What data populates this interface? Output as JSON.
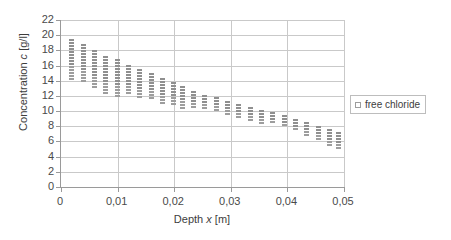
{
  "chart_data": {
    "type": "scatter",
    "title": "",
    "xlabel": "Depth x [m]",
    "ylabel": "Concentration c [g/l]",
    "xlim": [
      0,
      0.05
    ],
    "ylim": [
      0,
      22
    ],
    "ytick_step": 2,
    "xtick_step": 0.01,
    "grid": true,
    "legend_position": "right",
    "decimal_separator": ",",
    "series": [
      {
        "name": "free chloride",
        "marker": "open-square",
        "color": "#b4b4b4",
        "points": [
          {
            "x": 0.002,
            "y_low": 13.9,
            "y_high": 19.5
          },
          {
            "x": 0.004,
            "y_low": 13.8,
            "y_high": 18.8
          },
          {
            "x": 0.006,
            "y_low": 12.7,
            "y_high": 18.0
          },
          {
            "x": 0.008,
            "y_low": 12.2,
            "y_high": 17.2
          },
          {
            "x": 0.01,
            "y_low": 11.8,
            "y_high": 16.9
          },
          {
            "x": 0.012,
            "y_low": 12.2,
            "y_high": 16.1
          },
          {
            "x": 0.014,
            "y_low": 11.5,
            "y_high": 15.5
          },
          {
            "x": 0.016,
            "y_low": 11.3,
            "y_high": 15.0
          },
          {
            "x": 0.018,
            "y_low": 10.9,
            "y_high": 14.3
          },
          {
            "x": 0.02,
            "y_low": 10.5,
            "y_high": 13.8
          },
          {
            "x": 0.0215,
            "y_low": 10.3,
            "y_high": 13.3
          },
          {
            "x": 0.0235,
            "y_low": 10.2,
            "y_high": 12.7
          },
          {
            "x": 0.0255,
            "y_low": 10.0,
            "y_high": 12.1
          },
          {
            "x": 0.0275,
            "y_low": 9.8,
            "y_high": 11.8
          },
          {
            "x": 0.0295,
            "y_low": 9.4,
            "y_high": 11.3
          },
          {
            "x": 0.0315,
            "y_low": 9.0,
            "y_high": 11.0
          },
          {
            "x": 0.0335,
            "y_low": 8.7,
            "y_high": 10.6
          },
          {
            "x": 0.0355,
            "y_low": 8.4,
            "y_high": 10.2
          },
          {
            "x": 0.0375,
            "y_low": 8.2,
            "y_high": 9.9
          },
          {
            "x": 0.0395,
            "y_low": 7.8,
            "y_high": 9.5
          },
          {
            "x": 0.0415,
            "y_low": 7.3,
            "y_high": 9.0
          },
          {
            "x": 0.0435,
            "y_low": 6.6,
            "y_high": 8.6
          },
          {
            "x": 0.0455,
            "y_low": 6.0,
            "y_high": 8.0
          },
          {
            "x": 0.0475,
            "y_low": 5.4,
            "y_high": 7.6
          },
          {
            "x": 0.0492,
            "y_low": 4.9,
            "y_high": 7.2
          }
        ]
      }
    ],
    "ytick_labels": [
      "0",
      "2",
      "4",
      "6",
      "8",
      "10",
      "12",
      "14",
      "16",
      "18",
      "20",
      "22"
    ],
    "ytick_values": [
      0,
      2,
      4,
      6,
      8,
      10,
      12,
      14,
      16,
      18,
      20,
      22
    ],
    "xtick_labels": [
      "0",
      "0,01",
      "0,02",
      "0,03",
      "0,04",
      "0,05"
    ],
    "xtick_values": [
      0,
      0.01,
      0.02,
      0.03,
      0.04,
      0.05
    ]
  },
  "legend": {
    "entries": [
      {
        "label": "free chloride",
        "swatch_name": "legend-swatch-free-chloride"
      }
    ]
  },
  "axis_titles": {
    "x_prefix": "Depth ",
    "x_italic": "x",
    "x_suffix": " [m]",
    "y_prefix": "Concentration ",
    "y_italic": "c",
    "y_suffix": " [g/l]"
  },
  "colors": {
    "marker": "#b4b4b4",
    "marker_border": "#9d9d9d",
    "gridline": "#c9c9c9",
    "axis": "#9a9a9a",
    "text": "#4a4a4a",
    "background": "#ffffff"
  }
}
